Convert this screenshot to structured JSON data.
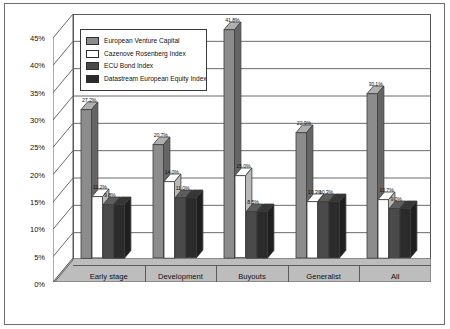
{
  "chart_data": {
    "type": "bar",
    "title": "",
    "subtitle": "",
    "xlabel": "",
    "ylabel": "",
    "ylim": [
      0,
      45
    ],
    "ytick_labels": [
      "0%",
      "5%",
      "10%",
      "15%",
      "20%",
      "25%",
      "30%",
      "35%",
      "40%",
      "45%"
    ],
    "ytick_values": [
      0,
      5,
      10,
      15,
      20,
      25,
      30,
      35,
      40,
      45
    ],
    "grid": true,
    "legend_position": "upper-left-inside",
    "categories": [
      "Early stage",
      "Development",
      "Buyouts",
      "Generalist",
      "All"
    ],
    "series": [
      {
        "name": "European Venture Capital",
        "color": "#8c8c8c",
        "values": [
          27.2,
          20.7,
          41.8,
          22.9,
          30.1
        ],
        "labels": [
          "27.2%",
          "20.7%",
          "41.8%",
          "22.9%",
          "30.1%"
        ]
      },
      {
        "name": "Cazenove Rosenberg Index",
        "color": "#ffffff",
        "values": [
          11.2,
          14.0,
          15.0,
          10.3,
          10.7
        ],
        "labels": [
          "11.2%",
          "14.0%",
          "15.0%",
          "10.3%",
          "10.7%"
        ]
      },
      {
        "name": "ECU Bond Index",
        "color": "#4a4a4a",
        "values": [
          9.8,
          11.0,
          8.5,
          10.3,
          9.0
        ],
        "labels": [
          "9.8%",
          "11.0%",
          "8.5%",
          "10.3%",
          "9.0%"
        ]
      },
      {
        "name": "Datastream European Equity Index",
        "color": "#2b2b2b",
        "values": [
          9.8,
          11.0,
          8.5,
          10.3,
          9.0
        ],
        "labels": [
          "",
          "",
          "",
          "",
          ""
        ]
      }
    ]
  },
  "legend": {
    "items": [
      {
        "label": "European Venture Capital",
        "color": "#8c8c8c"
      },
      {
        "label": "Cazenove Rosenberg Index",
        "color": "#ffffff"
      },
      {
        "label": "ECU Bond Index",
        "color": "#4a4a4a"
      },
      {
        "label": "Datastream European Equity Index",
        "color": "#2b2b2b"
      }
    ]
  }
}
